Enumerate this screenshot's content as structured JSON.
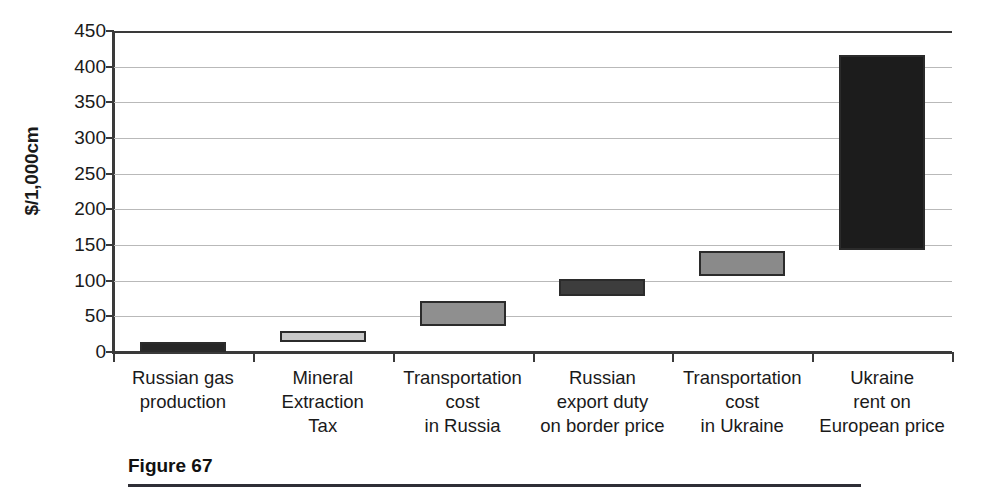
{
  "chart_data": {
    "type": "bar",
    "subtype": "waterfall-floating-bar",
    "title": "",
    "xlabel": "",
    "ylabel": "$/1,000cm",
    "ylim": [
      0,
      450
    ],
    "ytick_step": 50,
    "yticks": [
      450,
      400,
      350,
      300,
      250,
      200,
      150,
      100,
      50,
      0
    ],
    "grid": true,
    "legend": false,
    "categories": [
      "Russian gas production",
      "Mineral Extraction Tax",
      "Transportation cost in Russia",
      "Russian export duty on border price",
      "Transportation cost in Ukraine",
      "Ukraine rent on European price"
    ],
    "category_label_lines": [
      [
        "Russian gas",
        "production"
      ],
      [
        "Mineral",
        "Extraction",
        "Tax"
      ],
      [
        "Transportation",
        "cost",
        "in Russia"
      ],
      [
        "Russian",
        "export duty",
        "on border price"
      ],
      [
        "Transportation",
        "cost",
        "in Ukraine"
      ],
      [
        "Ukraine",
        "rent on",
        "European price"
      ]
    ],
    "bars": [
      {
        "label": "Russian gas production",
        "base": 0,
        "top": 14,
        "value": 14,
        "fill": "#262626"
      },
      {
        "label": "Mineral Extraction Tax",
        "base": 14,
        "top": 29,
        "value": 15,
        "fill": "#c8c8c8"
      },
      {
        "label": "Transportation cost in Russia",
        "base": 36,
        "top": 71,
        "value": 35,
        "fill": "#8f8f8f"
      },
      {
        "label": "Russian export duty on border price",
        "base": 78,
        "top": 103,
        "value": 25,
        "fill": "#3d3d3d"
      },
      {
        "label": "Transportation cost in Ukraine",
        "base": 107,
        "top": 142,
        "value": 35,
        "fill": "#8a8a8a"
      },
      {
        "label": "Ukraine rent on European price",
        "base": 143,
        "top": 417,
        "value": 274,
        "fill": "#1c1c1c"
      }
    ],
    "colors": {
      "axis": "#3a3a3a",
      "gridline": "#b9b9b9",
      "bar_border": "#2b2b2b",
      "text": "#1a1a1a"
    }
  },
  "caption": {
    "title": "Figure 67"
  }
}
